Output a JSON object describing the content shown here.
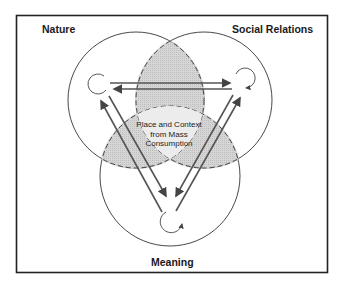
{
  "diagram": {
    "title": "Place and Context from Mass Consumption",
    "labels": {
      "nature": "Nature",
      "social_relations": "Social Relations",
      "meaning": "Meaning"
    },
    "center": {
      "line1": "Place and Context",
      "line2": "from Mass",
      "line3": "Consumption"
    },
    "colors": {
      "stroke": "#333333",
      "shade": "#d4d4d4",
      "frame": "#222222",
      "background": "#ffffff"
    }
  }
}
